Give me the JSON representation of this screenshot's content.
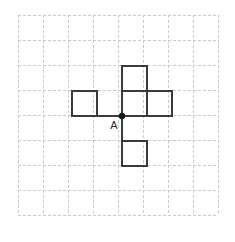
{
  "canvas": {
    "width": 235,
    "height": 242,
    "background": "#ffffff"
  },
  "grid": {
    "name": "dashed-square-grid",
    "origin_x": 18,
    "origin_y": 15,
    "cell_size": 25,
    "cols": 8,
    "rows": 8,
    "line_color": "#c9c9c9",
    "line_width": 1,
    "dash": "3 2",
    "visible": true
  },
  "figure": {
    "name": "pentomino-cross-net",
    "stroke_color": "#3a3a3a",
    "stroke_width": 2,
    "fill_color": "none",
    "squares": [
      {
        "id": "top-square",
        "col": 4,
        "row": 2,
        "x": 122,
        "y": 66,
        "w": 25,
        "h": 25
      },
      {
        "id": "left-square",
        "col": 2,
        "row": 3,
        "x": 72,
        "y": 91,
        "w": 25,
        "h": 25
      },
      {
        "id": "middle-square",
        "col": 4,
        "row": 3,
        "x": 122,
        "y": 91,
        "w": 25,
        "h": 25
      },
      {
        "id": "right-square",
        "col": 5,
        "row": 3,
        "x": 147,
        "y": 91,
        "w": 25,
        "h": 25
      },
      {
        "id": "bottom-square",
        "col": 4,
        "row": 5,
        "x": 122,
        "y": 141,
        "w": 25,
        "h": 25
      }
    ],
    "connector": {
      "id": "stem-segment",
      "x1": 122,
      "y1": 116,
      "x2": 122,
      "y2": 141
    },
    "baseline": {
      "id": "baseline-segment",
      "x1": 72,
      "y1": 116,
      "x2": 172,
      "y2": 116
    }
  },
  "point": {
    "name": "point-a",
    "label": "A",
    "x": 122,
    "y": 116,
    "radius": 3.2,
    "color": "#1a1a1a",
    "label_x": 114,
    "label_y": 129,
    "label_color": "#2b2b2b"
  }
}
